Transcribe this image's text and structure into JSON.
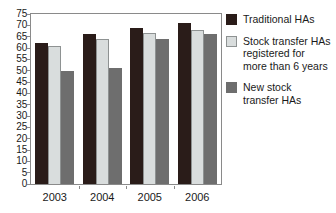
{
  "chart_data": {
    "type": "bar",
    "title": "",
    "subtitle": "",
    "xlabel": "",
    "ylabel": "",
    "categories": [
      "2003",
      "2004",
      "2005",
      "2006"
    ],
    "series": [
      {
        "name": "Traditional HAs",
        "color": "#2a1c19",
        "values": [
          62,
          66,
          69,
          71
        ]
      },
      {
        "name": "Stock transfer HAs registered for more than 6 years",
        "color": "#d9dddd",
        "values": [
          61,
          64,
          66.5,
          68
        ]
      },
      {
        "name": "New stock transfer HAs",
        "color": "#6e6e6e",
        "values": [
          50,
          51,
          64,
          66
        ]
      }
    ],
    "ylim": [
      0,
      75
    ],
    "ytick_step": 5,
    "yticks": [
      "0",
      "5",
      "10",
      "15",
      "20",
      "25",
      "30",
      "35",
      "40",
      "45",
      "50",
      "55",
      "60",
      "65",
      "70",
      "75"
    ],
    "grid": false,
    "legend_position": "right",
    "plot_border": true,
    "bar_orientation": "vertical",
    "grouped": true
  },
  "legend": {
    "items": [
      {
        "label": "Traditional HAs",
        "swatch": "legend-swatch-traditional"
      },
      {
        "label": "Stock transfer HAs\nregistered for\nmore than 6 years",
        "swatch": "legend-swatch-stock-transfer"
      },
      {
        "label": "New stock\ntransfer HAs",
        "swatch": "legend-swatch-new-stock"
      }
    ]
  },
  "colors": {
    "series_traditional": "#2a1c19",
    "series_stock_transfer": "#d9dddd",
    "series_new_stock": "#6e6e6e",
    "axis": "#8a8a8a",
    "text": "#1a1a1a",
    "background": "#ffffff"
  }
}
